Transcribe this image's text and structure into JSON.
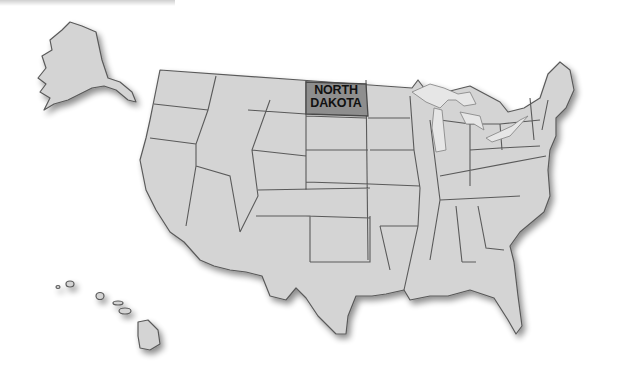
{
  "map": {
    "type": "us-states-outline",
    "highlighted_state": {
      "name": "North Dakota",
      "label_line1": "NORTH",
      "label_line2": "DAKOTA",
      "fill": "#8e8e8e"
    },
    "base_fill": "#d4d4d4",
    "border_color": "#5a5a5a",
    "background": "#ffffff",
    "insets": [
      "Alaska",
      "Hawaii"
    ]
  }
}
